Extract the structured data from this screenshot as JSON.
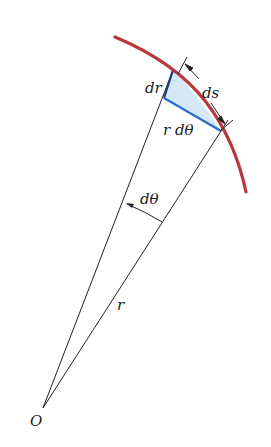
{
  "diagram": {
    "type": "polar-arc-length-element",
    "labels": {
      "dr": "dr",
      "ds": "ds",
      "r_dtheta": "r dθ",
      "dtheta": "dθ",
      "r": "r",
      "origin": "O"
    },
    "colors": {
      "curve": "#b7393a",
      "radial_segment": "#1e4a9a",
      "arc_segment_rdtheta": "#2a6dc9",
      "triangle_fill": "#d6e8f5",
      "lines": "#222222"
    },
    "points": {
      "origin": [
        43,
        408
      ],
      "ray1_end": [
        173,
        70
      ],
      "ray2_end": [
        221,
        131
      ],
      "dr_inner": [
        164,
        98
      ]
    }
  }
}
